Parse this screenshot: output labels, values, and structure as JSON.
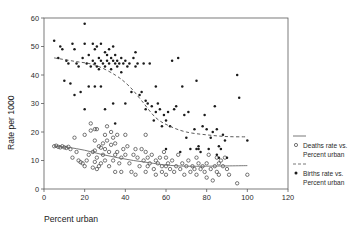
{
  "chart_data": {
    "type": "scatter",
    "title": "",
    "xlabel": "Percent urban",
    "ylabel": "Rate per 1000",
    "xlim": [
      0,
      120
    ],
    "ylim": [
      0,
      60
    ],
    "xticks": [
      "0",
      "20",
      "40",
      "60",
      "80",
      "100",
      "120"
    ],
    "yticks": [
      "0",
      "10",
      "20",
      "30",
      "40",
      "50",
      "60"
    ],
    "grid": false,
    "legend_position": "right",
    "series": [
      {
        "name": "deaths",
        "legend_line1": "Deaths rate vs.",
        "legend_line2": "Percent urban",
        "marker": "open-circle",
        "color": "#3c3c3c",
        "points": [
          [
            5,
            15
          ],
          [
            6,
            15.2
          ],
          [
            7,
            14.8
          ],
          [
            8,
            14.6
          ],
          [
            9,
            15
          ],
          [
            10,
            14.6
          ],
          [
            11,
            14.4
          ],
          [
            12,
            14.8
          ],
          [
            13,
            14
          ],
          [
            14,
            11
          ],
          [
            15,
            18
          ],
          [
            16,
            13
          ],
          [
            17,
            10
          ],
          [
            18,
            9.4
          ],
          [
            19,
            9
          ],
          [
            20,
            8
          ],
          [
            20,
            19
          ],
          [
            21,
            10
          ],
          [
            22,
            12
          ],
          [
            23,
            23
          ],
          [
            23,
            20.5
          ],
          [
            24,
            13
          ],
          [
            24,
            7.5
          ],
          [
            25,
            21
          ],
          [
            25,
            17
          ],
          [
            25,
            13.5
          ],
          [
            25,
            9.5
          ],
          [
            26,
            21
          ],
          [
            26,
            11
          ],
          [
            26,
            7
          ],
          [
            27,
            15
          ],
          [
            27,
            8
          ],
          [
            28,
            14.5
          ],
          [
            28,
            9
          ],
          [
            29,
            16
          ],
          [
            29,
            12
          ],
          [
            30,
            19
          ],
          [
            30,
            14
          ],
          [
            30,
            10
          ],
          [
            31,
            22
          ],
          [
            31,
            17
          ],
          [
            32,
            13
          ],
          [
            32,
            8
          ],
          [
            33,
            20
          ],
          [
            33,
            15.5
          ],
          [
            34,
            18
          ],
          [
            34,
            10
          ],
          [
            35,
            16
          ],
          [
            35,
            12
          ],
          [
            35,
            6
          ],
          [
            36,
            19
          ],
          [
            36,
            13
          ],
          [
            37,
            9
          ],
          [
            38,
            11
          ],
          [
            38,
            6
          ],
          [
            39,
            14
          ],
          [
            40,
            19
          ],
          [
            40,
            12
          ],
          [
            41,
            15
          ],
          [
            42,
            9
          ],
          [
            43,
            6
          ],
          [
            44,
            12
          ],
          [
            45,
            14
          ],
          [
            45,
            5
          ],
          [
            46,
            11
          ],
          [
            47,
            8
          ],
          [
            48,
            14
          ],
          [
            49,
            10
          ],
          [
            50,
            19
          ],
          [
            50,
            13
          ],
          [
            50,
            6
          ],
          [
            51,
            11
          ],
          [
            51,
            8
          ],
          [
            52,
            9
          ],
          [
            53,
            12
          ],
          [
            54,
            7
          ],
          [
            55,
            10
          ],
          [
            55,
            5
          ],
          [
            56,
            9
          ],
          [
            57,
            11
          ],
          [
            58,
            8
          ],
          [
            58,
            6
          ],
          [
            59,
            13
          ],
          [
            60,
            11
          ],
          [
            60,
            8
          ],
          [
            60,
            5
          ],
          [
            61,
            9
          ],
          [
            62,
            7
          ],
          [
            63,
            10
          ],
          [
            64,
            6
          ],
          [
            65,
            8
          ],
          [
            66,
            12
          ],
          [
            67,
            7
          ],
          [
            68,
            9
          ],
          [
            69,
            5
          ],
          [
            70,
            8
          ],
          [
            71,
            10
          ],
          [
            72,
            6
          ],
          [
            73,
            8
          ],
          [
            74,
            7
          ],
          [
            75,
            11
          ],
          [
            75,
            5
          ],
          [
            76,
            9
          ],
          [
            77,
            7
          ],
          [
            78,
            8
          ],
          [
            79,
            6
          ],
          [
            80,
            9
          ],
          [
            80,
            4
          ],
          [
            81,
            12
          ],
          [
            82,
            7
          ],
          [
            83,
            3
          ],
          [
            84,
            8
          ],
          [
            85,
            11
          ],
          [
            85,
            6
          ],
          [
            86,
            9
          ],
          [
            86,
            5
          ],
          [
            87,
            10
          ],
          [
            88,
            8
          ],
          [
            89,
            11
          ],
          [
            90,
            7
          ],
          [
            91,
            5
          ],
          [
            95,
            2
          ],
          [
            100,
            5
          ]
        ]
      },
      {
        "name": "births",
        "legend_line1": "Births rate vs.",
        "legend_line2": "Percent urban",
        "marker": "filled-dot",
        "color": "#1b1b1b",
        "points": [
          [
            5,
            52
          ],
          [
            7,
            46
          ],
          [
            8,
            50
          ],
          [
            9,
            49
          ],
          [
            10,
            38
          ],
          [
            11,
            45
          ],
          [
            12,
            44
          ],
          [
            13,
            37
          ],
          [
            14,
            51
          ],
          [
            15,
            49
          ],
          [
            15,
            33
          ],
          [
            16,
            44
          ],
          [
            17,
            43
          ],
          [
            18,
            34
          ],
          [
            19,
            46
          ],
          [
            20,
            58
          ],
          [
            20,
            51
          ],
          [
            20,
            28
          ],
          [
            21,
            44
          ],
          [
            22,
            47
          ],
          [
            22,
            36
          ],
          [
            23,
            43
          ],
          [
            24,
            51
          ],
          [
            24,
            45
          ],
          [
            25,
            49
          ],
          [
            25,
            44
          ],
          [
            25,
            36
          ],
          [
            26,
            50
          ],
          [
            26,
            43
          ],
          [
            27,
            46
          ],
          [
            27,
            42
          ],
          [
            28,
            51
          ],
          [
            28,
            45
          ],
          [
            28,
            36
          ],
          [
            29,
            44
          ],
          [
            30,
            48
          ],
          [
            30,
            43
          ],
          [
            30,
            28
          ],
          [
            31,
            47
          ],
          [
            31,
            45
          ],
          [
            32,
            49
          ],
          [
            32,
            44
          ],
          [
            33,
            46
          ],
          [
            33,
            42
          ],
          [
            34,
            50
          ],
          [
            34,
            45
          ],
          [
            34,
            30
          ],
          [
            35,
            47
          ],
          [
            35,
            44
          ],
          [
            35,
            23
          ],
          [
            36,
            45
          ],
          [
            36,
            43
          ],
          [
            37,
            44
          ],
          [
            38,
            46
          ],
          [
            38,
            41
          ],
          [
            39,
            44
          ],
          [
            40,
            45
          ],
          [
            40,
            30
          ],
          [
            41,
            43
          ],
          [
            42,
            44
          ],
          [
            43,
            34
          ],
          [
            44,
            46
          ],
          [
            45,
            48
          ],
          [
            45,
            43
          ],
          [
            46,
            44
          ],
          [
            47,
            33
          ],
          [
            48,
            34
          ],
          [
            49,
            44
          ],
          [
            50,
            31
          ],
          [
            50,
            28
          ],
          [
            51,
            30
          ],
          [
            52,
            44
          ],
          [
            53,
            29
          ],
          [
            54,
            24
          ],
          [
            55,
            36
          ],
          [
            55,
            27
          ],
          [
            56,
            30
          ],
          [
            57,
            28
          ],
          [
            58,
            22
          ],
          [
            59,
            26
          ],
          [
            60,
            14
          ],
          [
            60,
            24
          ],
          [
            61,
            27
          ],
          [
            62,
            22
          ],
          [
            63,
            45
          ],
          [
            64,
            28
          ],
          [
            65,
            29
          ],
          [
            66,
            46
          ],
          [
            67,
            13
          ],
          [
            68,
            36
          ],
          [
            69,
            26
          ],
          [
            70,
            18
          ],
          [
            71,
            27
          ],
          [
            72,
            14
          ],
          [
            74,
            21
          ],
          [
            75,
            38
          ],
          [
            75,
            14
          ],
          [
            76,
            15
          ],
          [
            76,
            14
          ],
          [
            77,
            13
          ],
          [
            78,
            22
          ],
          [
            79,
            26
          ],
          [
            80,
            21
          ],
          [
            81,
            14
          ],
          [
            82,
            18
          ],
          [
            83,
            20
          ],
          [
            84,
            29
          ],
          [
            85,
            12
          ],
          [
            85,
            21
          ],
          [
            86,
            15
          ],
          [
            86,
            11
          ],
          [
            87,
            14
          ],
          [
            88,
            19
          ],
          [
            89,
            17
          ],
          [
            90,
            11
          ],
          [
            95,
            40
          ],
          [
            96,
            32
          ],
          [
            100,
            17
          ]
        ]
      }
    ],
    "trends": [
      {
        "name": "births-trend",
        "style": "dashed",
        "points": [
          [
            5,
            46
          ],
          [
            15,
            44.8
          ],
          [
            25,
            43.5
          ],
          [
            35,
            40
          ],
          [
            42,
            36
          ],
          [
            48,
            31
          ],
          [
            55,
            25
          ],
          [
            62,
            22
          ],
          [
            70,
            20
          ],
          [
            80,
            19
          ],
          [
            90,
            18.4
          ],
          [
            100,
            18.3
          ]
        ]
      },
      {
        "name": "deaths-trend",
        "style": "solid",
        "points": [
          [
            5,
            15
          ],
          [
            12,
            14.6
          ],
          [
            20,
            13.6
          ],
          [
            28,
            12.2
          ],
          [
            36,
            11
          ],
          [
            44,
            10
          ],
          [
            52,
            9.2
          ],
          [
            60,
            8.4
          ],
          [
            70,
            8
          ],
          [
            80,
            8
          ],
          [
            90,
            8.1
          ],
          [
            100,
            8.2
          ]
        ]
      }
    ]
  }
}
